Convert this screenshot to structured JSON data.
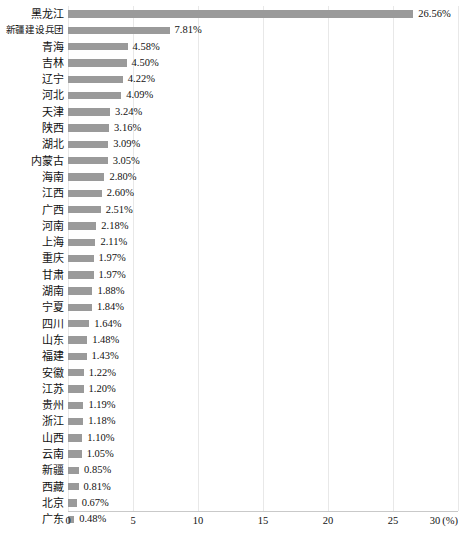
{
  "chart_data": {
    "type": "bar",
    "orientation": "horizontal",
    "title": "",
    "xlabel": "(%)",
    "ylabel": "",
    "xlim": [
      0,
      30
    ],
    "xticks": [
      0,
      5,
      10,
      15,
      20,
      25,
      30
    ],
    "xtick_labels": [
      "0",
      "5",
      "10",
      "15",
      "20",
      "25",
      "30"
    ],
    "x_unit_label": "(%)",
    "grid": true,
    "legend": false,
    "bar_color": "#9a9a9a",
    "value_label_suffix": "%",
    "categories": [
      "黑龙江",
      "新疆建设兵团",
      "青海",
      "吉林",
      "辽宁",
      "河北",
      "天津",
      "陕西",
      "湖北",
      "内蒙古",
      "海南",
      "江西",
      "广西",
      "河南",
      "上海",
      "重庆",
      "甘肃",
      "湖南",
      "宁夏",
      "四川",
      "山东",
      "福建",
      "安徽",
      "江苏",
      "贵州",
      "浙江",
      "山西",
      "云南",
      "新疆",
      "西藏",
      "北京",
      "广东"
    ],
    "values": [
      26.56,
      7.81,
      4.58,
      4.5,
      4.22,
      4.09,
      3.24,
      3.16,
      3.09,
      3.05,
      2.8,
      2.6,
      2.51,
      2.18,
      2.11,
      1.97,
      1.97,
      1.88,
      1.84,
      1.64,
      1.48,
      1.43,
      1.22,
      1.2,
      1.19,
      1.18,
      1.1,
      1.05,
      0.85,
      0.81,
      0.67,
      0.48
    ],
    "value_labels": [
      "26.56%",
      "7.81%",
      "4.58%",
      "4.50%",
      "4.22%",
      "4.09%",
      "3.24%",
      "3.16%",
      "3.09%",
      "3.05%",
      "2.80%",
      "2.60%",
      "2.51%",
      "2.18%",
      "2.11%",
      "1.97%",
      "1.97%",
      "1.88%",
      "1.84%",
      "1.64%",
      "1.48%",
      "1.43%",
      "1.22%",
      "1.20%",
      "1.19%",
      "1.18%",
      "1.10%",
      "1.05%",
      "0.85%",
      "0.81%",
      "0.67%",
      "0.48%"
    ]
  },
  "caption": ""
}
